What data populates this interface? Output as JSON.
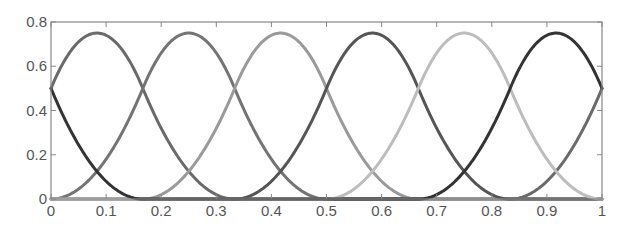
{
  "chart_data": {
    "type": "line",
    "title": "",
    "xlabel": "",
    "ylabel": "",
    "xlim": [
      0,
      1
    ],
    "ylim": [
      0,
      0.8
    ],
    "grid": false,
    "legend": "none",
    "xticks": [
      0,
      0.1,
      0.2,
      0.3,
      0.4,
      0.5,
      0.6,
      0.7,
      0.8,
      0.9,
      1
    ],
    "xtick_labels": [
      "0",
      "0.1",
      "0.2",
      "0.3",
      "0.4",
      "0.5",
      "0.6",
      "0.7",
      "0.8",
      "0.9",
      "1"
    ],
    "yticks": [
      0,
      0.2,
      0.4,
      0.6,
      0.8
    ],
    "ytick_labels": [
      "0",
      "0.2",
      "0.4",
      "0.6",
      "0.8"
    ],
    "series": [
      {
        "name": "basis-1",
        "color": "#6a6a6a",
        "peak_x": 0.0833,
        "peak_y": 0.75,
        "support": [
          0.0,
          0.5
        ],
        "x": [
          0,
          0.0833,
          0.1667,
          0.25,
          0.3333,
          0.4167,
          0.5
        ],
        "y": [
          0,
          0.125,
          0.5,
          0.75,
          0.5,
          0.125,
          0
        ]
      },
      {
        "name": "basis-2",
        "color": "#747474",
        "peak_x": 0.25,
        "peak_y": 0.75,
        "support": [
          0.1667,
          0.6667
        ]
      },
      {
        "name": "basis-3",
        "color": "#9a9a9a",
        "peak_x": 0.4167,
        "peak_y": 0.75,
        "support": [
          0.3333,
          0.8333
        ]
      },
      {
        "name": "basis-4",
        "color": "#555555",
        "peak_x": 0.5833,
        "peak_y": 0.75,
        "support": [
          0.5,
          1.0
        ]
      },
      {
        "name": "basis-5",
        "color": "#bdbdbd",
        "peak_x": 0.75,
        "peak_y": 0.75,
        "support": [
          0.6667,
          1.1667
        ]
      },
      {
        "name": "basis-6",
        "color": "#333333",
        "peak_x": 0.9167,
        "peak_y": 0.75,
        "support": [
          0.8333,
          1.3333
        ]
      }
    ]
  }
}
